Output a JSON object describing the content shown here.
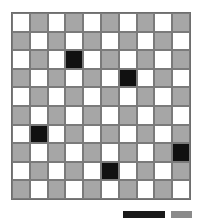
{
  "board": {
    "rows": 10,
    "cols": 10,
    "pattern": "checkerboard",
    "colors": {
      "light": "#ffffff",
      "dark": "#a6a6a6",
      "filled": "#111111",
      "grid_line": "#6e6e6e"
    },
    "filled_cells": [
      {
        "row": 2,
        "col": 3
      },
      {
        "row": 3,
        "col": 6
      },
      {
        "row": 6,
        "col": 1
      },
      {
        "row": 7,
        "col": 9
      },
      {
        "row": 8,
        "col": 5
      }
    ]
  },
  "footer": {
    "black_bar_color": "#1a1a1a",
    "gray_bar_color": "#8a8a8a"
  }
}
